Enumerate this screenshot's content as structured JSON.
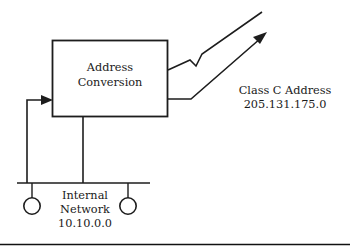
{
  "figure": {
    "background_color": "#ffffff",
    "line_color": "#1d1d1d"
  },
  "box": {
    "label_line1": "Address",
    "label_line2": "Conversion"
  },
  "external": {
    "label_line1": "Class C Address",
    "label_line2": "205.131.175.0"
  },
  "internal": {
    "label_line1": "Internal",
    "label_line2": "Network",
    "label_line3": "10.10.0.0"
  },
  "nodes": {
    "left_host": "host-node-left",
    "right_host": "host-node-right"
  },
  "connectors": {
    "inbound": "feedback-arrow-to-box",
    "outbound_upper": "upper-external-link",
    "outbound_lower": "lower-external-link",
    "downlink": "box-to-bus-link",
    "bus": "internal-network-bus"
  }
}
